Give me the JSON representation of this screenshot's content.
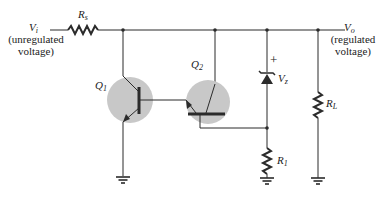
{
  "diagram": {
    "type": "circuit-schematic",
    "colors": {
      "wire": "#2b2b2b",
      "transistor_fill": "#c8c8c8",
      "background": "#ffffff"
    },
    "labels": {
      "vi": {
        "main": "V",
        "sub": "i"
      },
      "vi_note_1": "(unregulated",
      "vi_note_2": "voltage)",
      "vo": {
        "main": "V",
        "sub": "o"
      },
      "vo_note_1": "(regulated",
      "vo_note_2": "voltage)",
      "rs": {
        "main": "R",
        "sub": "s"
      },
      "q1": {
        "main": "Q",
        "sub": "1"
      },
      "q2": {
        "main": "Q",
        "sub": "2"
      },
      "vz": {
        "main": "V",
        "sub": "z"
      },
      "vz_plus": "+",
      "r1": {
        "main": "R",
        "sub": "1"
      },
      "rl": {
        "main": "R",
        "sub": "L"
      }
    },
    "components": [
      {
        "id": "Rs",
        "kind": "resistor",
        "orientation": "horizontal"
      },
      {
        "id": "Q1",
        "kind": "npn-transistor"
      },
      {
        "id": "Q2",
        "kind": "npn-transistor"
      },
      {
        "id": "Vz",
        "kind": "zener-diode"
      },
      {
        "id": "R1",
        "kind": "resistor",
        "orientation": "vertical"
      },
      {
        "id": "RL",
        "kind": "resistor",
        "orientation": "vertical"
      },
      {
        "id": "GND1",
        "kind": "ground"
      },
      {
        "id": "GND2",
        "kind": "ground"
      },
      {
        "id": "GND3",
        "kind": "ground"
      }
    ]
  }
}
